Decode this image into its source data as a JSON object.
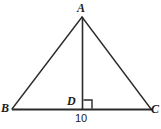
{
  "figure": {
    "kind": "geometry-diagram",
    "background_color": "#ffffff",
    "stroke_color": "#2b2b2b",
    "label_color": "#1a1a1a",
    "labels": {
      "apex": "A",
      "left_vertex": "B",
      "right_vertex": "C",
      "foot_of_altitude": "D",
      "base_length": "10"
    },
    "points": {
      "A": {
        "x": 82,
        "y": 17
      },
      "B": {
        "x": 12,
        "y": 109
      },
      "C": {
        "x": 151,
        "y": 109
      },
      "D": {
        "x": 82,
        "y": 109
      }
    },
    "segments": [
      {
        "name": "side-AB",
        "from": "A",
        "to": "B",
        "width": 1.4
      },
      {
        "name": "side-AC",
        "from": "A",
        "to": "C",
        "width": 1.4
      },
      {
        "name": "base-BC",
        "from": "B",
        "to": "C",
        "width": 2.2
      },
      {
        "name": "altitude-AD",
        "from": "A",
        "to": "D",
        "width": 1.6
      }
    ],
    "right_angle_mark": {
      "at": "D",
      "size": 9,
      "orientation": "right-of-altitude-above-base"
    }
  }
}
